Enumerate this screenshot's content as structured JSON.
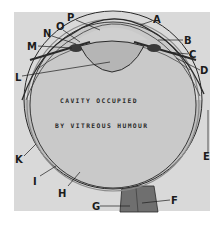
{
  "figure": {
    "caption_line1": "CAVITY OCCUPIED",
    "caption_line2": "BY VITREOUS HUMOUR",
    "colors": {
      "page": "#ffffff",
      "panel": "#d9d9d9",
      "cavity": "#c9c9c9",
      "wall_outer": "#7a7a7a",
      "wall_band": "#bdbdbd",
      "nerve": "#6b6b6b",
      "line": "#2a2a2a"
    },
    "labels": {
      "A": "A",
      "B": "B",
      "C": "C",
      "D": "D",
      "E": "E",
      "F": "F",
      "G": "G",
      "H": "H",
      "I": "I",
      "K": "K",
      "L": "L",
      "M": "M",
      "N": "N",
      "O": "O",
      "P": "P"
    }
  }
}
